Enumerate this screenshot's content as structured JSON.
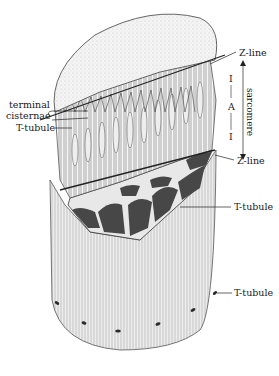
{
  "figure": {
    "colors": {
      "background": "#ffffff",
      "ink": "#1a1a1a",
      "myofibril_fill": "#c9c9c9",
      "cross_section_dark": "#4a4a4a",
      "sarcolemma_fill": "#e4e4e4",
      "top_surface": "#efefef"
    }
  },
  "labels": {
    "z_line_top": "Z-line",
    "z_line_bottom": "Z-line",
    "i_band_top": "I",
    "a_band": "A",
    "i_band_bottom": "I",
    "sarcomere": "sarcomere",
    "terminal_cisternae_1": "terminal",
    "terminal_cisternae_2": "cisternae",
    "t_tubule_left": "T-tubule",
    "t_tubule_mid": "T-tubule",
    "t_tubule_bottom": "T-tubule"
  }
}
